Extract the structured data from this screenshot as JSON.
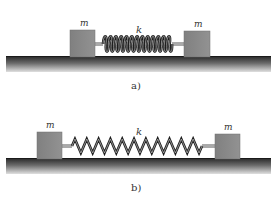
{
  "figure": {
    "panels": [
      {
        "id": "a",
        "label": "a)",
        "mass_left_label": "m",
        "mass_right_label": "m",
        "spring_label": "k",
        "spring_state": "compressed",
        "spring_turns": 13
      },
      {
        "id": "b",
        "label": "b)",
        "mass_left_label": "m",
        "mass_right_label": "m",
        "spring_label": "k",
        "spring_state": "stretched",
        "spring_turns": 11
      }
    ],
    "colors": {
      "block_fill": "#8a8a8a",
      "block_edge": "#6e6e6e",
      "ground_dark": "#2a2a2a",
      "ground_light": "#d8d8d8",
      "spring_dark": "#1e1e1e",
      "spring_light": "#bdbdbd",
      "rod": "#555555"
    }
  }
}
